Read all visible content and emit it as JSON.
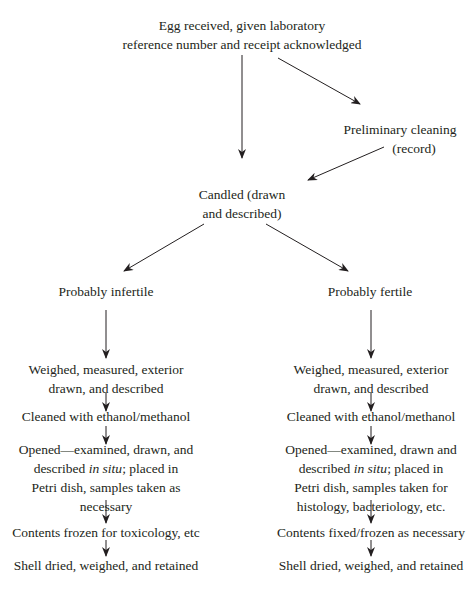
{
  "diagram": {
    "type": "flowchart",
    "top": {
      "received": [
        "Egg received, given laboratory",
        "reference number and receipt acknowledged"
      ],
      "cleaning": [
        "Preliminary cleaning",
        "(record)"
      ],
      "candled": [
        "Candled (drawn",
        "and described)"
      ]
    },
    "left_branch": {
      "title": "Probably infertile",
      "steps": {
        "weighed": [
          "Weighed, measured, exterior",
          "drawn, and described"
        ],
        "cleaned": "Cleaned with ethanol/methanol",
        "opened_a": "Opened—examined, drawn, and",
        "opened_b_pre": "described ",
        "opened_b_italic": "in situ",
        "opened_b_post": "; placed in",
        "opened_c": "Petri dish, samples taken as",
        "opened_d": "necessary",
        "contents": "Contents frozen for toxicology, etc",
        "shell": "Shell dried, weighed, and retained"
      }
    },
    "right_branch": {
      "title": "Probably fertile",
      "steps": {
        "weighed": [
          "Weighed, measured, exterior",
          "drawn, and described"
        ],
        "cleaned": "Cleaned with ethanol/methanol",
        "opened_a": "Opened—examined, drawn and",
        "opened_b_pre": "described ",
        "opened_b_italic": "in situ",
        "opened_b_post": "; placed in",
        "opened_c": "Petri dish, samples taken for",
        "opened_d": "histology, bacteriology, etc.",
        "contents": "Contents fixed/frozen as necessary",
        "shell": "Shell dried, weighed, and retained"
      }
    },
    "colors": {
      "text": "#231f20",
      "line": "#231f20",
      "background": "#ffffff"
    }
  }
}
